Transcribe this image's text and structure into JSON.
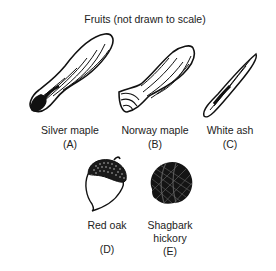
{
  "title": "Fruits (not drawn to scale)",
  "fruits": [
    {
      "name": "Silver maple",
      "letter": "(A)",
      "icon": "silver-maple-samara-icon"
    },
    {
      "name": "Norway maple",
      "letter": "(B)",
      "icon": "norway-maple-samara-icon"
    },
    {
      "name": "White ash",
      "letter": "(C)",
      "icon": "white-ash-samara-icon"
    },
    {
      "name": "Red oak",
      "letter": "(D)",
      "icon": "acorn-icon"
    },
    {
      "name_line1": "Shagbark",
      "name_line2": "hickory",
      "letter": "(E)",
      "icon": "hickory-nut-icon"
    }
  ],
  "colors": {
    "ink": "#111111",
    "background": "#ffffff"
  }
}
